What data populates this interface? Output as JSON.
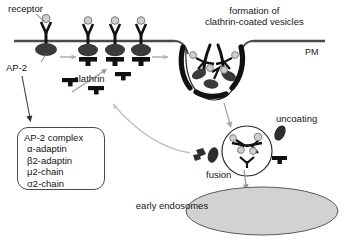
{
  "diagram": {
    "type": "cell-biology-schematic"
  },
  "labels": {
    "receptor": "receptor",
    "ap2": "AP-2",
    "clathrin": "clathrin",
    "formation_line1": "formation of",
    "formation_line2": "clathrin-coated vesicles",
    "pm": "PM",
    "uncoating": "uncoating",
    "fusion": "fusion",
    "early_endosomes": "early endosomes"
  },
  "ap2_complex_box": {
    "title": "AP-2 complex",
    "subunits": [
      "α-adaptin",
      "β2-adaptin",
      "μ2-chain",
      "σ2-chain"
    ]
  },
  "icons": {
    "receptor": "receptor-y-icon",
    "ap2_adaptor": "ap2-ellipse-icon",
    "clathrin_triskelion": "clathrin-triskelion-icon",
    "coated_pit": "coated-pit-icon",
    "coated_vesicle": "coated-vesicle-icon",
    "endosome": "early-endosome-ellipse-icon",
    "stage_arrow": "arrow-right-icon",
    "budding_arrow": "arrow-down-icon",
    "recycling_path": "recycling-curve-icon",
    "leader_line": "leader-line-icon"
  },
  "colors": {
    "membrane": "#4a4a4a",
    "ink": "#161616",
    "receptor_head": "#c9c9c9",
    "ap2_fill": "#3a3a3a",
    "clathrin_fill": "#111111",
    "coat_arc": "#111111",
    "endosome_fill": "#d2d2d2",
    "endosome_stroke": "#5a5a5a",
    "arrow_grey": "#b0b0b0",
    "curve_grey": "#bdbdbd",
    "background": "#ffffff"
  }
}
